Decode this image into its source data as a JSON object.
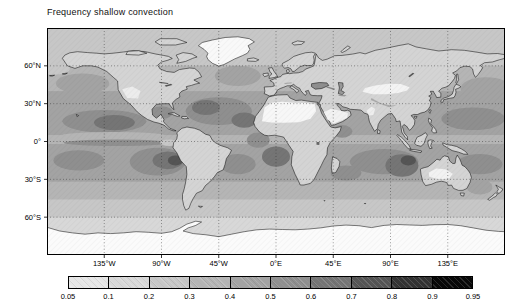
{
  "figure": {
    "title": "Frequency shallow convection",
    "background": "#ffffff"
  },
  "chart_data": {
    "type": "heatmap",
    "subtype": "filled-contour world map",
    "title": "Frequency shallow convection",
    "projection": "equirectangular",
    "lon_range": [
      -180,
      180
    ],
    "lat_range": [
      -90,
      90
    ],
    "grid": "dotted graticule every 45 deg longitude and 30 deg latitude",
    "x_ticks": [
      {
        "label": "135°W",
        "lon": -135
      },
      {
        "label": "90°W",
        "lon": -90
      },
      {
        "label": "45°W",
        "lon": -45
      },
      {
        "label": "0°E",
        "lon": 0
      },
      {
        "label": "45°E",
        "lon": 45
      },
      {
        "label": "90°E",
        "lon": 90
      },
      {
        "label": "135°E",
        "lon": 135
      }
    ],
    "y_ticks": [
      {
        "label": "60°N",
        "lat": 60
      },
      {
        "label": "30°N",
        "lat": 30
      },
      {
        "label": "0°",
        "lat": 0
      },
      {
        "label": "30°S",
        "lat": -30
      },
      {
        "label": "60°S",
        "lat": -60
      }
    ],
    "colorbar": {
      "orientation": "horizontal",
      "levels": [
        0.05,
        0.1,
        0.2,
        0.3,
        0.4,
        0.5,
        0.6,
        0.7,
        0.8,
        0.9,
        0.95
      ],
      "labels": [
        "0.05",
        "0.1",
        "0.2",
        "0.3",
        "0.4",
        "0.5",
        "0.6",
        "0.7",
        "0.8",
        "0.9",
        "0.95"
      ],
      "colors": [
        "#e6e6e6",
        "#d8d8d8",
        "#c7c7c7",
        "#b5b5b5",
        "#a3a3a3",
        "#8f8f8f",
        "#757575",
        "#555555",
        "#333333",
        "#080808"
      ],
      "below_min_color": "#ffffff"
    },
    "values_estimated": [
      {
        "region": "subtropical SE Pacific off Peru/Chile",
        "frequency": "0.6-0.8"
      },
      {
        "region": "subtropical SE Atlantic off Angola/Namibia",
        "frequency": "0.6-0.7"
      },
      {
        "region": "NE Pacific trade-wind region off Mexico/Hawaii",
        "frequency": "0.5-0.7"
      },
      {
        "region": "subtropical N Atlantic off NW Africa / Sargasso",
        "frequency": "0.5-0.7"
      },
      {
        "region": "S Indian Ocean west/northwest of Australia",
        "frequency": "0.5-0.7"
      },
      {
        "region": "general trade-wind oceans 5-35 deg N/S",
        "frequency": "0.4-0.5"
      },
      {
        "region": "narrow band just south of equator, central Pacific",
        "frequency": "0.5"
      },
      {
        "region": "equatorial band and eastern Pacific cold tongue",
        "frequency": "0.2-0.3"
      },
      {
        "region": "mid- and high-latitude oceans",
        "frequency": "0.3-0.4"
      },
      {
        "region": "most land areas",
        "frequency": "0.1-0.3"
      },
      {
        "region": "Sahara, Arabia, central Asia, NW India, central Australia",
        "frequency": "<0.05"
      },
      {
        "region": "Greenland and Antarctica",
        "frequency": "<0.05"
      }
    ]
  }
}
